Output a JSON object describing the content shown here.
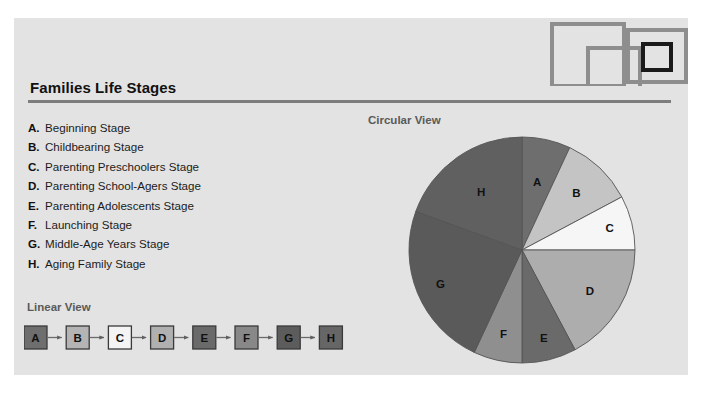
{
  "card": {
    "background_color": "#e3e3e3"
  },
  "logo": {
    "name": "overlapping-squares-logo",
    "squares": [
      {
        "x": 4,
        "y": 22,
        "size": 56,
        "stroke": "#8a8a8a",
        "width": 4
      },
      {
        "x": 36,
        "y": 44,
        "size": 46,
        "stroke": "#8a8a8a",
        "width": 4
      },
      {
        "x": 70,
        "y": 30,
        "size": 46,
        "stroke": "#8a8a8a",
        "width": 4
      },
      {
        "x": 82,
        "y": 42,
        "size": 26,
        "stroke": "#111111",
        "width": 4
      }
    ]
  },
  "header": {
    "title": "Families Life Stages"
  },
  "legend": {
    "items": [
      {
        "key": "A.",
        "label": "Beginning Stage"
      },
      {
        "key": "B.",
        "label": "Childbearing Stage"
      },
      {
        "key": "C.",
        "label": "Parenting Preschoolers Stage"
      },
      {
        "key": "D.",
        "label": "Parenting School-Agers Stage"
      },
      {
        "key": "E.",
        "label": "Parenting Adolescents Stage"
      },
      {
        "key": "F.",
        "label": "Launching Stage"
      },
      {
        "key": "G.",
        "label": "Middle-Age Years Stage"
      },
      {
        "key": "H.",
        "label": "Aging Family Stage"
      }
    ]
  },
  "linear_view": {
    "heading": "Linear View",
    "nodes": [
      {
        "label": "A",
        "fill": "#6e6e6e"
      },
      {
        "label": "B",
        "fill": "#b4b4b4"
      },
      {
        "label": "C",
        "fill": "#f4f4f4"
      },
      {
        "label": "D",
        "fill": "#b0b0b0"
      },
      {
        "label": "E",
        "fill": "#6a6a6a"
      },
      {
        "label": "F",
        "fill": "#888888"
      },
      {
        "label": "G",
        "fill": "#5c5c5c"
      },
      {
        "label": "H",
        "fill": "#666666"
      }
    ],
    "connector_color": "#6b6b6b",
    "node_border_color": "#3a3a3a"
  },
  "circular_view": {
    "heading": "Circular View"
  },
  "chart_data": {
    "type": "pie",
    "title": "Circular View",
    "labels": [
      "A",
      "B",
      "C",
      "D",
      "E",
      "F",
      "G",
      "H"
    ],
    "names": [
      "Beginning Stage",
      "Childbearing Stage",
      "Parenting Preschoolers Stage",
      "Parenting School-Agers Stage",
      "Parenting Adolescents Stage",
      "Launching Stage",
      "Middle-Age Years Stage",
      "Aging Family Stage"
    ],
    "start_angles_deg": [
      0,
      25,
      62,
      90,
      152,
      180,
      205,
      290
    ],
    "end_angles_deg": [
      25,
      62,
      90,
      152,
      180,
      205,
      290,
      360
    ],
    "values_deg": [
      25,
      37,
      28,
      62,
      28,
      25,
      85,
      70
    ],
    "values_pct": [
      6.9,
      10.3,
      7.8,
      17.2,
      7.8,
      6.9,
      23.6,
      19.4
    ],
    "colors": [
      "#6e6e6e",
      "#c4c4c4",
      "#f6f6f6",
      "#adadad",
      "#6a6a6a",
      "#8f8f8f",
      "#5a5a5a",
      "#606060"
    ],
    "stroke": "#555555",
    "legend": "outside-slice-labels",
    "rotation": "starts at 12 o'clock, clockwise",
    "grid": false
  }
}
